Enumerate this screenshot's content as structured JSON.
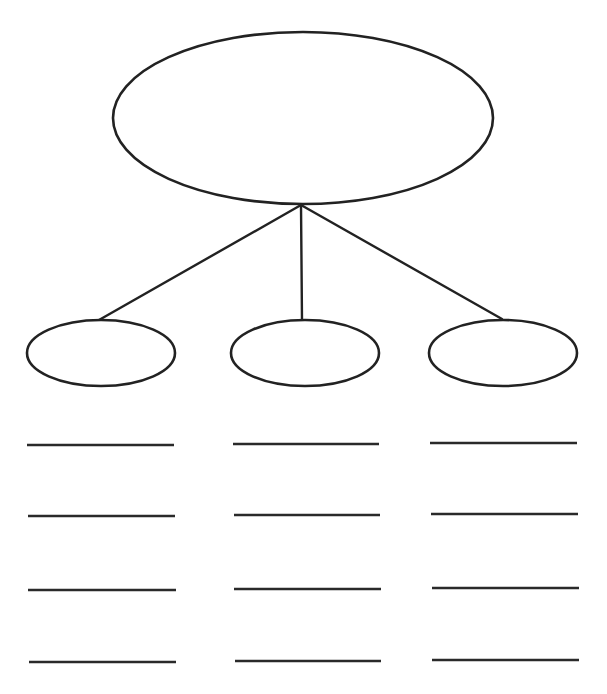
{
  "diagram": {
    "type": "concept-map",
    "stroke_color": "#222222",
    "background": "#ffffff",
    "main_topic": {
      "label": "",
      "cx": 303,
      "cy": 118,
      "rx": 190,
      "ry": 86
    },
    "connector_origin": {
      "x": 301,
      "y": 205
    },
    "subtopics": [
      {
        "label": "",
        "cx": 101,
        "cy": 353,
        "rx": 74,
        "ry": 33,
        "connector_end": {
          "x": 99,
          "y": 320
        },
        "detail_lines": [
          {
            "x1": 27,
            "x2": 174,
            "y": 445,
            "text": ""
          },
          {
            "x1": 28,
            "x2": 175,
            "y": 516,
            "text": ""
          },
          {
            "x1": 28,
            "x2": 176,
            "y": 590,
            "text": ""
          },
          {
            "x1": 29,
            "x2": 176,
            "y": 662,
            "text": ""
          }
        ]
      },
      {
        "label": "",
        "cx": 305,
        "cy": 353,
        "rx": 74,
        "ry": 33,
        "connector_end": {
          "x": 302,
          "y": 320
        },
        "detail_lines": [
          {
            "x1": 233,
            "x2": 379,
            "y": 444,
            "text": ""
          },
          {
            "x1": 234,
            "x2": 380,
            "y": 515,
            "text": ""
          },
          {
            "x1": 234,
            "x2": 381,
            "y": 589,
            "text": ""
          },
          {
            "x1": 235,
            "x2": 381,
            "y": 661,
            "text": ""
          }
        ]
      },
      {
        "label": "",
        "cx": 503,
        "cy": 353,
        "rx": 74,
        "ry": 33,
        "connector_end": {
          "x": 502,
          "y": 319
        },
        "detail_lines": [
          {
            "x1": 430,
            "x2": 577,
            "y": 443,
            "text": ""
          },
          {
            "x1": 431,
            "x2": 578,
            "y": 514,
            "text": ""
          },
          {
            "x1": 432,
            "x2": 579,
            "y": 588,
            "text": ""
          },
          {
            "x1": 432,
            "x2": 579,
            "y": 660,
            "text": ""
          }
        ]
      }
    ]
  }
}
